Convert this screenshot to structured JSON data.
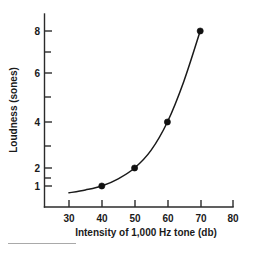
{
  "chart_data": {
    "type": "line",
    "title": "",
    "xlabel": "Intensity of 1,000 Hz tone (db)",
    "ylabel": "Loudness (sones)",
    "x": [
      40,
      50,
      60,
      70
    ],
    "values": [
      1,
      2,
      4,
      8
    ],
    "series": [
      {
        "name": "Loudness",
        "x": [
          40,
          50,
          60,
          70
        ],
        "values": [
          1,
          2,
          4,
          8
        ]
      }
    ],
    "curve_points": [
      {
        "x": 30,
        "y": 0.72
      },
      {
        "x": 35,
        "y": 0.84
      },
      {
        "x": 40,
        "y": 1.0
      },
      {
        "x": 45,
        "y": 1.4
      },
      {
        "x": 50,
        "y": 2.0
      },
      {
        "x": 55,
        "y": 2.8
      },
      {
        "x": 60,
        "y": 4.0
      },
      {
        "x": 65,
        "y": 5.65
      },
      {
        "x": 70,
        "y": 8.0
      }
    ],
    "xlim": [
      25,
      80
    ],
    "ylim": [
      0.55,
      8.8
    ],
    "xticks": [
      30,
      40,
      50,
      60,
      70,
      80
    ],
    "xtick_labels": [
      "30",
      "40",
      "50",
      "60",
      "70",
      "80"
    ],
    "yticks": [
      1,
      2,
      4,
      6,
      8
    ],
    "ytick_labels": [
      "1",
      "2",
      "4",
      "6",
      "8"
    ],
    "y_minor_ticks": [
      1.5,
      3,
      5,
      7
    ],
    "y_scale": "nonlinear",
    "grid": false,
    "legend": false,
    "marker": "filled-circle",
    "line_color": "#1a1a1a",
    "marker_color": "#111111",
    "background_color": "#ffffff"
  },
  "figure": {
    "footnote_rule_visible": true
  }
}
